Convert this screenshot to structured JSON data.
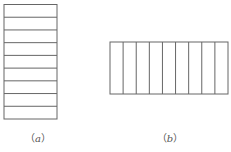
{
  "figures": [
    {
      "id": "a",
      "label_open": "（",
      "label_letter": "a",
      "label_close": "）",
      "orientation": "horizontal-strips",
      "divisions": 9,
      "rect": {
        "x": 4,
        "y": 4.5,
        "width": 53,
        "height": 114.5
      },
      "label_x": 38,
      "label_y": 130
    },
    {
      "id": "b",
      "label_open": "（",
      "label_letter": "b",
      "label_close": "）",
      "orientation": "vertical-strips",
      "divisions": 9,
      "rect": {
        "x": 110,
        "y": 42,
        "width": 118,
        "height": 52
      },
      "label_x": 170,
      "label_y": 130
    }
  ],
  "colors": {
    "stroke": "#666666",
    "background": "#ffffff"
  }
}
